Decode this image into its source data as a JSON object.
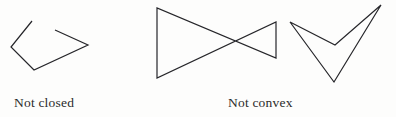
{
  "figure": {
    "background_color": "#fdfdfc",
    "stroke_color": "#26262a",
    "stroke_width": 1.2,
    "width": 396,
    "height": 117
  },
  "shapes": [
    {
      "name": "open-polyline-not-closed",
      "kind": "polyline",
      "closed": false,
      "convex": false,
      "points": "32,21 11,47 34,70 88,45 55,30",
      "vertices": [
        [
          32,
          21
        ],
        [
          11,
          47
        ],
        [
          34,
          70
        ],
        [
          88,
          45
        ],
        [
          55,
          30
        ]
      ]
    },
    {
      "name": "bowtie-polygon-not-convex",
      "kind": "polygon",
      "closed": true,
      "convex": false,
      "points": "157,8 157,78 276,22 276,58",
      "vertices": [
        [
          157,
          8
        ],
        [
          157,
          78
        ],
        [
          276,
          22
        ],
        [
          276,
          58
        ]
      ]
    },
    {
      "name": "chevron-polygon-not-convex",
      "kind": "polygon",
      "closed": true,
      "convex": false,
      "points": "290,22 334,82 381,5 335,45",
      "vertices": [
        [
          290,
          22
        ],
        [
          334,
          82
        ],
        [
          381,
          5
        ],
        [
          335,
          45
        ]
      ]
    }
  ],
  "captions": {
    "not_closed": "Not closed",
    "not_convex": "Not convex"
  }
}
